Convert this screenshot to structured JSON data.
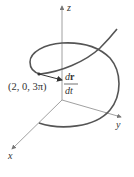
{
  "diagram": {
    "type": "3d-space-curve",
    "axes": {
      "x": {
        "label": "x"
      },
      "y": {
        "label": "y"
      },
      "z": {
        "label": "z"
      }
    },
    "point": {
      "label": "(2, 0, 3π)"
    },
    "tangent_vector": {
      "numerator": "d",
      "numerator_bold": "r",
      "denominator": "dt"
    },
    "colors": {
      "curve": "#555555",
      "axes": "#888888",
      "text": "#333333"
    }
  }
}
